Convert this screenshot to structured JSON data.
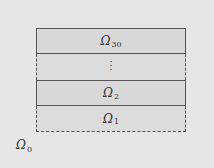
{
  "diagram": {
    "layers": [
      {
        "symbol": "Ω",
        "subscript": "30",
        "border": "solid"
      },
      {
        "symbol": "⋮",
        "subscript": "",
        "border": "dashed"
      },
      {
        "symbol": "Ω",
        "subscript": "2",
        "border": "solid"
      },
      {
        "symbol": "Ω",
        "subscript": "1",
        "border": "dashed"
      }
    ],
    "outer_label": {
      "symbol": "Ω",
      "subscript": "0"
    },
    "colors": {
      "background": "#e6e6e6",
      "layer_fill": "#d8d8d8",
      "border": "#555555"
    }
  }
}
